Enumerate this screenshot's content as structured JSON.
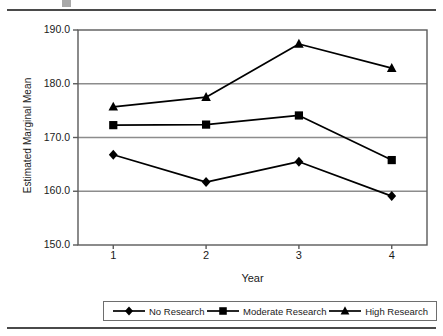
{
  "figure": {
    "top_rule": "horizontal-rule",
    "bottom_rule": "horizontal-rule",
    "caption_fragment": ""
  },
  "chart_data": {
    "type": "line",
    "title": "",
    "xlabel": "Year",
    "ylabel": "Estimated Marginal Mean",
    "categories": [
      "1",
      "2",
      "3",
      "4"
    ],
    "x": [
      1,
      2,
      3,
      4
    ],
    "xlim": [
      0.62,
      4.38
    ],
    "ylim": [
      150.0,
      190.0
    ],
    "ytick_labels": [
      "190.0",
      "180.0",
      "170.0",
      "160.0",
      "150.0"
    ],
    "yticks": [
      190.0,
      180.0,
      170.0,
      160.0,
      150.0
    ],
    "grid": "horizontal",
    "legend_position": "bottom",
    "series": [
      {
        "name": "No Research",
        "marker": "diamond",
        "color": "#000000",
        "values": [
          166.8,
          161.7,
          165.5,
          159.1
        ]
      },
      {
        "name": "Moderate Research",
        "marker": "square",
        "color": "#000000",
        "values": [
          172.3,
          172.4,
          174.1,
          165.8
        ]
      },
      {
        "name": "High Research",
        "marker": "triangle",
        "color": "#000000",
        "values": [
          175.7,
          177.5,
          187.4,
          182.9
        ]
      }
    ]
  },
  "legend": {
    "entries": [
      {
        "label": "No Research",
        "marker": "diamond-marker-icon"
      },
      {
        "label": "Moderate Research",
        "marker": "square-marker-icon"
      },
      {
        "label": "High Research",
        "marker": "triangle-marker-icon"
      }
    ]
  }
}
